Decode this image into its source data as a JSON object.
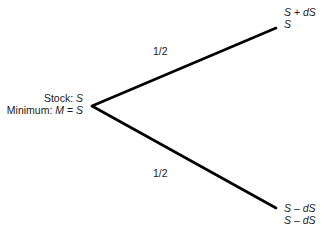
{
  "diagram": {
    "type": "binomial-tree",
    "root": {
      "line1_prefix": "Stock: ",
      "line1_var": "S",
      "line2_prefix": "Minimum: ",
      "line2_var": "M",
      "line2_eq": " = ",
      "line2_rhs": "S"
    },
    "branches": [
      {
        "direction": "up",
        "probability": "1/2",
        "stock": {
          "a": "S",
          "op": " + ",
          "b": "dS"
        },
        "minimum": {
          "a": "S"
        }
      },
      {
        "direction": "down",
        "probability": "1/2",
        "stock": {
          "a": "S",
          "op": " – ",
          "b": "dS"
        },
        "minimum": {
          "a": "S",
          "op": " – ",
          "b": "dS"
        }
      }
    ],
    "line_color": "#000000"
  }
}
